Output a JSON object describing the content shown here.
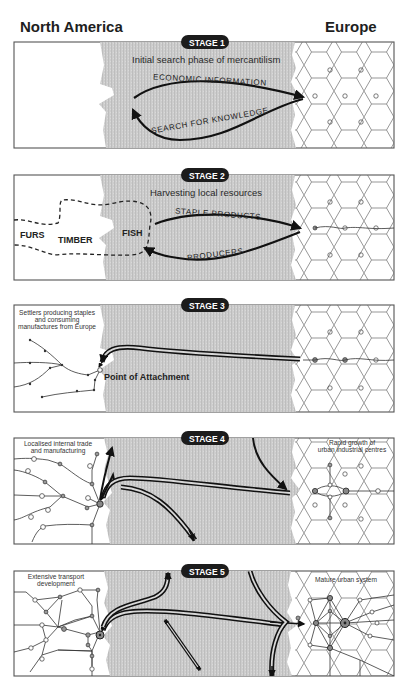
{
  "regions": {
    "left": "North America",
    "right": "Europe"
  },
  "stages": [
    {
      "badge": "STAGE 1",
      "subtitle": "Initial search phase of mercantilism",
      "flows": [
        "ECONOMIC INFORMATION",
        "SEARCH FOR KNOWLEDGE"
      ]
    },
    {
      "badge": "STAGE 2",
      "subtitle": "Harvesting local resources",
      "flows": [
        "STAPLE PRODUCTS",
        "PRODUCERS"
      ],
      "resources": [
        "FURS",
        "TIMBER",
        "FISH"
      ]
    },
    {
      "badge": "STAGE 3",
      "note_lines": [
        "Settlers producing staples",
        "and consuming",
        "manufactures from Europe"
      ],
      "point_label": "Point of Attachment"
    },
    {
      "badge": "STAGE 4",
      "left_note_lines": [
        "Localised internal trade",
        "and manufacturing"
      ],
      "right_note_lines": [
        "Rapid growth of",
        "urban industrial centres"
      ]
    },
    {
      "badge": "STAGE 5",
      "left_note_lines": [
        "Extensive transport",
        "development"
      ],
      "right_note": "Mature urban system"
    }
  ],
  "colors": {
    "ocean": "#c9c9c9",
    "ink": "#1e1e1e",
    "badge": "#1c1c1c",
    "node_fill": "#9a9a9a"
  }
}
